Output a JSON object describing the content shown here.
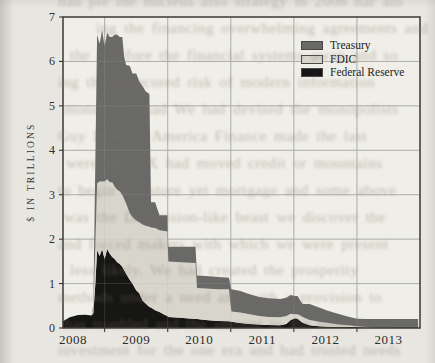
{
  "page": {
    "background_color": "#e8e6e1",
    "kind": "scanned book page with chart"
  },
  "bleed_lines": [
    "had ple the nucleus also strategy in 2008 har alo",
    "ing the financing overwhelming agreements and",
    "the I before the financial systems away and so",
    "ing the unsecured risk of modern information",
    "money We had We had devised the monopolists",
    "Guy Bear of America Finance made the last",
    "were MG SX had moved credit or mountains",
    "to begin the store yet mortgage and some above",
    "was the Depression-like beast we discover the",
    "and forced makers with which we were present",
    "less likely. We had created the prosperity",
    "methods under a need and with a provision to",
    "has troubled and the amount to the most in",
    "investment for the one era and had trusted needs"
  ],
  "chart_data": {
    "type": "area",
    "stacked": true,
    "title": "",
    "xlabel": "",
    "ylabel": "$ IN TRILLIONS",
    "ylim": [
      0,
      7
    ],
    "yticks": [
      0,
      1,
      2,
      3,
      4,
      5,
      6,
      7
    ],
    "x_range": [
      2008.34,
      2014.0
    ],
    "year_gridlines": [
      2009,
      2010,
      2011,
      2012,
      2013
    ],
    "year_labels": [
      "2008",
      "2009",
      "2010",
      "2011",
      "2012",
      "2013"
    ],
    "year_label_positions": [
      2008.5,
      2009.5,
      2010.5,
      2011.5,
      2012.5,
      2013.5
    ],
    "grid": true,
    "grid_color": "#a9aca6",
    "axis_color": "#3a3834",
    "plot_bg": "#f0eee8",
    "legend_position": "top-right-inside",
    "legend": [
      {
        "label": "Treasury",
        "color": "#696967"
      },
      {
        "label": "FDIC",
        "color": "#d8d5cd"
      },
      {
        "label": "Federal Reserve",
        "color": "#161614"
      }
    ],
    "x": [
      2008.34,
      2008.45,
      2008.58,
      2008.7,
      2008.79,
      2008.82,
      2008.85,
      2008.88,
      2008.92,
      2008.96,
      2009.0,
      2009.04,
      2009.08,
      2009.12,
      2009.16,
      2009.2,
      2009.24,
      2009.28,
      2009.31,
      2009.34,
      2009.4,
      2009.44,
      2009.5,
      2009.55,
      2009.6,
      2009.65,
      2009.71,
      2009.735,
      2009.8,
      2009.87,
      2009.95,
      2009.995,
      2010.01,
      2010.2,
      2010.44,
      2010.465,
      2010.6,
      2010.8,
      2010.97,
      2011.01,
      2011.15,
      2011.3,
      2011.45,
      2011.6,
      2011.78,
      2011.88,
      2011.95,
      2012.02,
      2012.06,
      2012.1,
      2012.14,
      2012.25,
      2012.4,
      2012.55,
      2012.7,
      2012.85,
      2013.0,
      2013.15,
      2013.35,
      2013.6,
      2013.8,
      2013.97
    ],
    "series": [
      {
        "name": "Federal Reserve",
        "color": "#161614",
        "values": [
          0.15,
          0.24,
          0.29,
          0.3,
          0.28,
          0.33,
          0.95,
          1.75,
          1.62,
          1.78,
          1.55,
          1.78,
          1.68,
          1.6,
          1.55,
          1.48,
          1.44,
          1.38,
          1.3,
          1.22,
          1.08,
          1.0,
          0.85,
          0.78,
          0.62,
          0.55,
          0.47,
          0.46,
          0.4,
          0.36,
          0.3,
          0.27,
          0.25,
          0.23,
          0.2,
          0.2,
          0.18,
          0.16,
          0.15,
          0.14,
          0.11,
          0.09,
          0.08,
          0.07,
          0.06,
          0.09,
          0.18,
          0.22,
          0.21,
          0.16,
          0.12,
          0.06,
          0.04,
          0.03,
          0.02,
          0.02,
          0.02,
          0.01,
          0.01,
          0.0,
          0.0,
          0.0
        ]
      },
      {
        "name": "FDIC",
        "color": "#d8d5cd",
        "values": [
          0.0,
          0.0,
          0.0,
          0.0,
          0.0,
          0.1,
          0.8,
          1.5,
          1.68,
          1.52,
          1.75,
          1.57,
          1.6,
          1.68,
          1.63,
          1.63,
          1.63,
          1.62,
          1.6,
          1.58,
          1.5,
          1.5,
          1.57,
          1.6,
          1.71,
          1.75,
          1.81,
          1.8,
          1.85,
          1.84,
          1.88,
          1.9,
          1.25,
          1.25,
          1.26,
          0.7,
          0.71,
          0.71,
          0.72,
          0.23,
          0.24,
          0.22,
          0.19,
          0.18,
          0.18,
          0.18,
          0.14,
          0.09,
          0.1,
          0.12,
          0.13,
          0.12,
          0.1,
          0.08,
          0.06,
          0.04,
          0.02,
          0.01,
          0.0,
          0.0,
          0.0,
          0.0
        ]
      },
      {
        "name": "Treasury",
        "color": "#696967",
        "values": [
          0.0,
          0.0,
          0.0,
          0.0,
          0.0,
          0.07,
          1.75,
          3.35,
          3.1,
          3.4,
          3.05,
          3.3,
          3.27,
          3.27,
          3.42,
          3.49,
          3.48,
          3.55,
          3.2,
          3.12,
          3.32,
          3.23,
          3.31,
          3.17,
          3.12,
          3.03,
          2.99,
          0.57,
          0.58,
          0.34,
          0.36,
          0.37,
          0.33,
          0.35,
          0.37,
          0.28,
          0.28,
          0.28,
          0.26,
          0.5,
          0.48,
          0.45,
          0.43,
          0.42,
          0.41,
          0.41,
          0.42,
          0.41,
          0.41,
          0.34,
          0.29,
          0.36,
          0.32,
          0.27,
          0.24,
          0.2,
          0.17,
          0.18,
          0.19,
          0.2,
          0.2,
          0.2
        ]
      }
    ]
  }
}
